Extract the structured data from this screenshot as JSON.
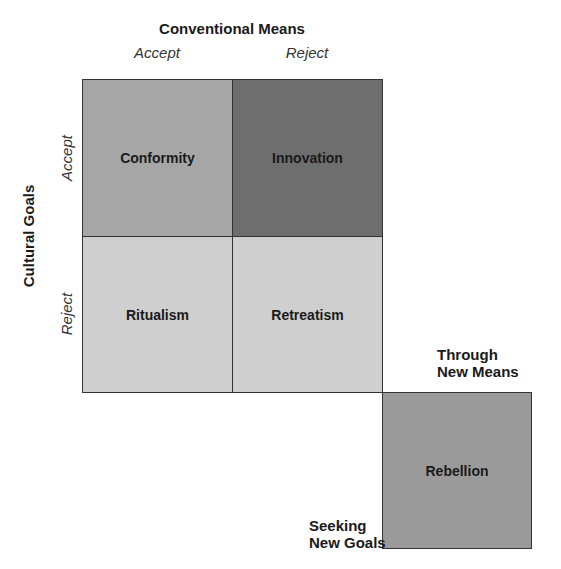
{
  "diagram": {
    "top_axis": {
      "title": "Conventional Means",
      "columns": [
        "Accept",
        "Reject"
      ]
    },
    "side_axis": {
      "title": "Cultural Goals",
      "rows": [
        "Accept",
        "Reject"
      ]
    },
    "cells": [
      {
        "label": "Conformity",
        "color": "#a6a6a6"
      },
      {
        "label": "Innovation",
        "color": "#6e6e6e"
      },
      {
        "label": "Ritualism",
        "color": "#cfcfcf"
      },
      {
        "label": "Retreatism",
        "color": "#cfcfcf"
      }
    ],
    "rebellion": {
      "label": "Rebellion",
      "color": "#9a9a9a",
      "top_note_line1": "Through",
      "top_note_line2": "New Means",
      "bottom_note_line1": "Seeking",
      "bottom_note_line2": "New Goals"
    }
  }
}
